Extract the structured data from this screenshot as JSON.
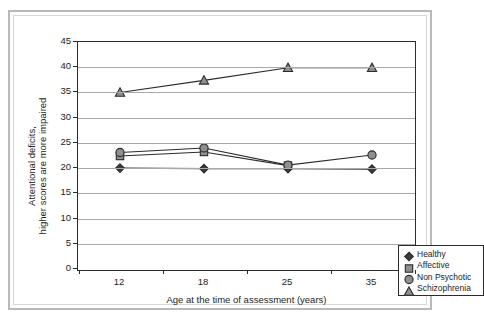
{
  "chart_data": {
    "type": "line",
    "title": "",
    "xlabel": "Age at the time of assessment (years)",
    "ylabel_line1": "Attentional deficits,",
    "ylabel_line2": "higher scores are more impaired",
    "categories": [
      "12",
      "18",
      "25",
      "35"
    ],
    "ylim": [
      0,
      45
    ],
    "ytick_labels": [
      "0",
      "5",
      "10",
      "15",
      "20",
      "25",
      "30",
      "35",
      "40",
      "45"
    ],
    "ytick_values": [
      0,
      5,
      10,
      15,
      20,
      25,
      30,
      35,
      40,
      45
    ],
    "grid": "horizontal",
    "legend_position": "bottom-right",
    "series": [
      {
        "name": "Healthy",
        "marker": "diamond",
        "color": "#3a3a3a",
        "values": [
          20.0,
          19.9,
          19.9,
          19.8
        ]
      },
      {
        "name": "Affective",
        "marker": "square",
        "color": "#8f8f8f",
        "values": [
          22.4,
          23.2,
          20.5,
          null
        ]
      },
      {
        "name": "Non Psychotic",
        "marker": "circle",
        "color": "#8f8f8f",
        "values": [
          23.1,
          24.0,
          20.6,
          22.6
        ]
      },
      {
        "name": "Schizophrenia",
        "marker": "triangle",
        "color": "#8f8f8f",
        "values": [
          35.0,
          37.4,
          39.9,
          39.9
        ]
      }
    ]
  }
}
